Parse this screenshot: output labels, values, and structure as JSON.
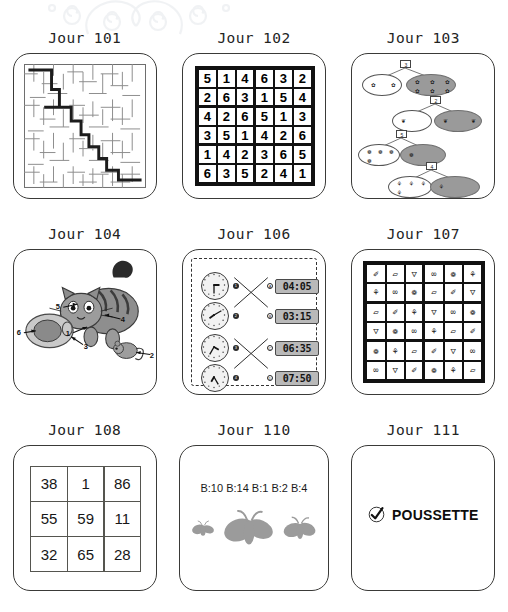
{
  "page": {
    "background_color": "#ffffff",
    "ornament": "decorative-swirl-flourish"
  },
  "puzzles": [
    {
      "id": "jour-101",
      "title": "Jour 101",
      "type": "maze",
      "description": "square maze with solved path drawn from top-left entrance to bottom-right exit"
    },
    {
      "id": "jour-102",
      "title": "Jour 102",
      "type": "number-sudoku",
      "size": "6x6",
      "rows": [
        [
          5,
          1,
          4,
          6,
          3,
          2
        ],
        [
          2,
          6,
          3,
          1,
          5,
          4
        ],
        [
          4,
          2,
          6,
          5,
          1,
          3
        ],
        [
          3,
          5,
          1,
          4,
          2,
          6
        ],
        [
          1,
          4,
          2,
          3,
          6,
          5
        ],
        [
          6,
          3,
          5,
          2,
          4,
          1
        ]
      ]
    },
    {
      "id": "jour-103",
      "title": "Jour 103",
      "type": "matching-pairs",
      "pairs": [
        {
          "box": "3",
          "left_count": 2,
          "right_count": 6,
          "glyph": "✿"
        },
        {
          "box": "2",
          "left_count": 1,
          "right_count": 2,
          "glyph": "❦"
        },
        {
          "box": "5",
          "left_count": 4,
          "right_count": 1,
          "glyph": "❁"
        },
        {
          "box": "4",
          "left_count": 4,
          "right_count": 1,
          "glyph": "⚘"
        }
      ]
    },
    {
      "id": "jour-104",
      "title": "Jour 104",
      "type": "labelled-picture",
      "scene": "cat with bowl and mouse",
      "labels": [
        "1",
        "2",
        "3",
        "4",
        "5",
        "6"
      ]
    },
    {
      "id": "jour-106",
      "title": "Jour 106",
      "type": "clock-matching",
      "clock_nodes": [
        "1",
        "2",
        "3",
        "4"
      ],
      "time_nodes": [
        "A",
        "B",
        "C",
        "D"
      ],
      "analog_times": [
        "03:15",
        "07:50",
        "04:05",
        "06:35"
      ],
      "digital_times": [
        "04:05",
        "03:15",
        "06:35",
        "07:50"
      ]
    },
    {
      "id": "jour-107",
      "title": "Jour 107",
      "type": "icon-sudoku",
      "size": "6x6",
      "icon_names": [
        "pencil-icon",
        "paper-icon",
        "underwear-icon",
        "glasses-icon",
        "butterfly-icon",
        "flower-icon"
      ],
      "icon_glyphs": [
        "✐",
        "▱",
        "▽",
        "∞",
        "❁",
        "⚘"
      ],
      "rows": [
        [
          0,
          1,
          2,
          3,
          4,
          5
        ],
        [
          5,
          3,
          4,
          1,
          0,
          2
        ],
        [
          1,
          0,
          5,
          2,
          3,
          4
        ],
        [
          2,
          4,
          3,
          5,
          1,
          0
        ],
        [
          4,
          5,
          1,
          0,
          2,
          3
        ],
        [
          3,
          2,
          0,
          4,
          5,
          1
        ]
      ]
    },
    {
      "id": "jour-108",
      "title": "Jour 108",
      "type": "number-grid",
      "size": "3x3",
      "rows": [
        [
          "38",
          "1",
          "86"
        ],
        [
          "55",
          "59",
          "11"
        ],
        [
          "32",
          "65",
          "28"
        ]
      ]
    },
    {
      "id": "jour-110",
      "title": "Jour 110",
      "type": "count-labels",
      "labels_text": "B:10 B:14 B:1 B:2 B:4",
      "figures": [
        "butterfly-small",
        "butterfly-large",
        "butterfly-medium"
      ]
    },
    {
      "id": "jour-111",
      "title": "Jour 111",
      "type": "word-answer",
      "check_icon": "check-mark-icon",
      "answer_word": "POUSSETTE"
    }
  ]
}
